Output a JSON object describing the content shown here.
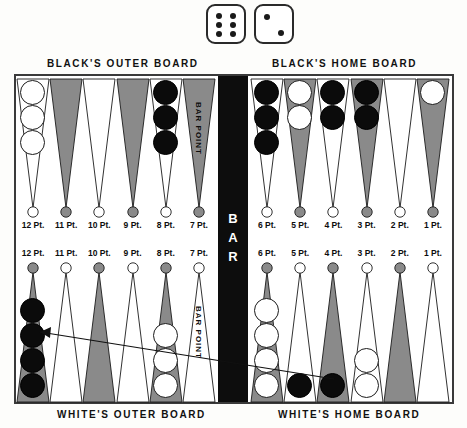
{
  "dice": {
    "name": "dice-roll",
    "left_die": 6,
    "right_die": 2
  },
  "captions": {
    "black_outer": "BLACK'S OUTER BOARD",
    "black_home": "BLACK'S HOME BOARD",
    "white_outer": "WHITE'S OUTER BOARD",
    "white_home": "WHITE'S HOME BOARD",
    "bar": "BAR",
    "bar_point": "BAR POINT"
  },
  "colors": {
    "shaded_point": "#8a8a8a",
    "white_point": "#ffffff",
    "black_checker": "#0b0b0b",
    "white_checker": "#ffffff",
    "bar_fill": "#0d0d0d",
    "outline": "#1b1b1b",
    "board_border": "#3a3a3a"
  },
  "board": {
    "top_left": {
      "section": "BLACK'S OUTER BOARD",
      "points": [
        {
          "label": "12 Pt.",
          "shade": "white",
          "checkers": "white",
          "count": 3
        },
        {
          "label": "11 Pt.",
          "shade": "shaded",
          "checkers": "none",
          "count": 0
        },
        {
          "label": "10 Pt.",
          "shade": "white",
          "checkers": "none",
          "count": 0
        },
        {
          "label": "9 Pt.",
          "shade": "shaded",
          "checkers": "none",
          "count": 0
        },
        {
          "label": "8 Pt.",
          "shade": "white",
          "checkers": "black",
          "count": 3
        },
        {
          "label": "7 Pt.",
          "shade": "shaded",
          "checkers": "none",
          "count": 0,
          "note": "BAR POINT"
        }
      ]
    },
    "top_right": {
      "section": "BLACK'S HOME BOARD",
      "points": [
        {
          "label": "6 Pt.",
          "shade": "white",
          "checkers": "black",
          "count": 3
        },
        {
          "label": "5 Pt.",
          "shade": "shaded",
          "checkers": "white",
          "count": 2
        },
        {
          "label": "4 Pt.",
          "shade": "white",
          "checkers": "black",
          "count": 2
        },
        {
          "label": "3 Pt.",
          "shade": "shaded",
          "checkers": "black",
          "count": 2
        },
        {
          "label": "2 Pt.",
          "shade": "white",
          "checkers": "none",
          "count": 0
        },
        {
          "label": "1 Pt.",
          "shade": "shaded",
          "checkers": "white",
          "count": 1
        }
      ]
    },
    "bottom_left": {
      "section": "WHITE'S OUTER BOARD",
      "points": [
        {
          "label": "12 Pt.",
          "shade": "shaded",
          "checkers": "black",
          "count": 4
        },
        {
          "label": "11 Pt.",
          "shade": "white",
          "checkers": "none",
          "count": 0
        },
        {
          "label": "10 Pt.",
          "shade": "shaded",
          "checkers": "none",
          "count": 0
        },
        {
          "label": "9 Pt.",
          "shade": "white",
          "checkers": "none",
          "count": 0
        },
        {
          "label": "8 Pt.",
          "shade": "shaded",
          "checkers": "white",
          "count": 3
        },
        {
          "label": "7 Pt.",
          "shade": "white",
          "checkers": "none",
          "count": 0,
          "note": "BAR POINT"
        }
      ]
    },
    "bottom_right": {
      "section": "WHITE'S HOME BOARD",
      "points": [
        {
          "label": "6 Pt.",
          "shade": "shaded",
          "checkers": "white",
          "count": 4
        },
        {
          "label": "5 Pt.",
          "shade": "white",
          "checkers": "black",
          "count": 1
        },
        {
          "label": "4 Pt.",
          "shade": "shaded",
          "checkers": "black",
          "count": 1
        },
        {
          "label": "3 Pt.",
          "shade": "white",
          "checkers": "white",
          "count": 2
        },
        {
          "label": "2 Pt.",
          "shade": "shaded",
          "checkers": "none",
          "count": 0
        },
        {
          "label": "1 Pt.",
          "shade": "white",
          "checkers": "none",
          "count": 0
        }
      ]
    }
  },
  "annotation": {
    "arrow_name": "move-arrow",
    "from_point": "4 Pt. (White's Home Board)",
    "to_point": "12 Pt. (White's Outer Board)"
  }
}
